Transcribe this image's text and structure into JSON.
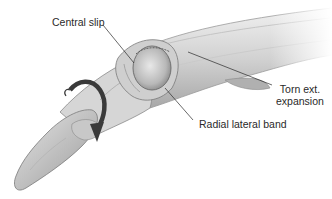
{
  "figure": {
    "labels": {
      "central_slip": "Central slip",
      "torn_ext_line1": "Torn ext.",
      "torn_ext_line2": "expansion",
      "radial_lateral_band": "Radial lateral band"
    },
    "colors": {
      "background": "#ffffff",
      "skin_light": "#e4e4e4",
      "skin_mid": "#c4c4c4",
      "skin_dark": "#8a8a8a",
      "arrow": "#3a3a3a",
      "leader_line": "#2a2a2a",
      "text": "#2a2a2a"
    }
  }
}
